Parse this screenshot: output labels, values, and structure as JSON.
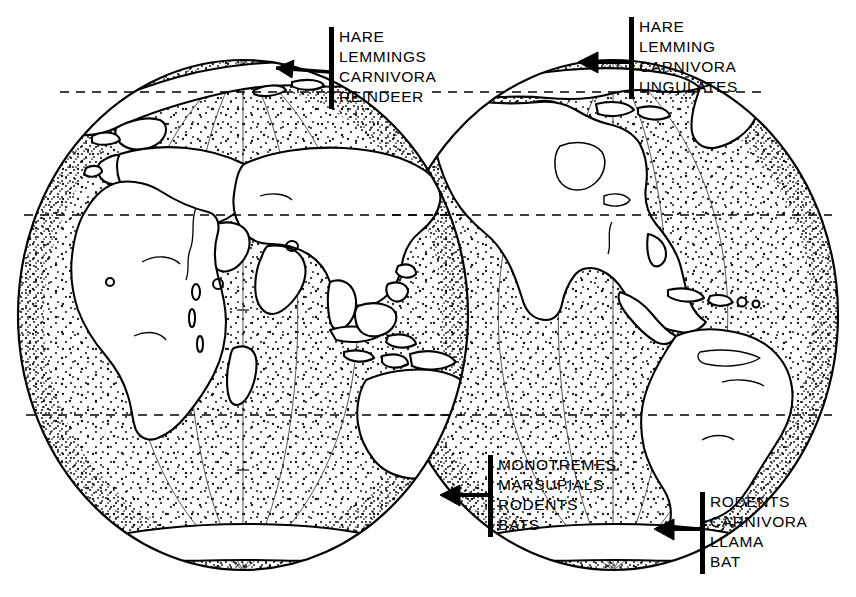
{
  "figure": {
    "background_color": "#ffffff",
    "ink_color": "#000000",
    "width": 856,
    "height": 597
  },
  "globes": [
    {
      "name": "eastern-hemisphere",
      "center_x": 243,
      "center_y": 315,
      "radius_x": 225,
      "radius_y": 255,
      "landmasses": [
        "Europe",
        "Africa",
        "Asia",
        "Australia",
        "Greenland",
        "Arctic",
        "Antarctica",
        "Madagascar",
        "Indonesia",
        "Philippines",
        "New Guinea",
        "New Zealand"
      ]
    },
    {
      "name": "western-hemisphere",
      "center_x": 613,
      "center_y": 315,
      "radius_x": 225,
      "radius_y": 255,
      "landmasses": [
        "North America",
        "South America",
        "Greenland",
        "Arctic",
        "Antarctica",
        "Caribbean",
        "Central America"
      ]
    }
  ],
  "latitude_lines": [
    {
      "name": "arctic-circle",
      "y": 92,
      "style": "dashed"
    },
    {
      "name": "tropic-of-cancer",
      "y": 215,
      "style": "dashed"
    },
    {
      "name": "tropic-of-capricorn",
      "y": 415,
      "style": "dashed"
    }
  ],
  "callouts": [
    {
      "id": "callout-ne",
      "name": "arctic-eurasia-callout",
      "points_to": "Arctic northern Eurasia",
      "items": [
        "HARE",
        "LEMMINGS",
        "CARNIVORA",
        "REINDEER"
      ]
    },
    {
      "id": "callout-nw",
      "name": "arctic-north-america-callout",
      "points_to": "Arctic northern North America",
      "items": [
        "HARE",
        "LEMMING",
        "CARNIVORA",
        "UNGULATES"
      ]
    },
    {
      "id": "callout-au",
      "name": "australia-callout",
      "points_to": "Southeastern Australia",
      "items": [
        "MONOTREMES",
        "MARSUPIALS",
        "RODENTS",
        "BATS"
      ]
    },
    {
      "id": "callout-sa",
      "name": "south-america-callout",
      "points_to": "Southern tip of South America",
      "items": [
        "RODENTS",
        "CARNIVORA",
        "LLAMA",
        "BAT"
      ]
    }
  ]
}
